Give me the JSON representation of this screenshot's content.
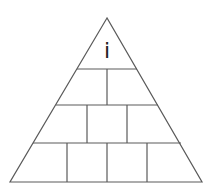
{
  "diagram": {
    "type": "pyramid",
    "apex_label": "i",
    "rows": [
      {
        "level": 1,
        "cells": 1,
        "labels": [
          "i"
        ]
      },
      {
        "level": 2,
        "cells": 2,
        "labels": [
          "",
          ""
        ]
      },
      {
        "level": 3,
        "cells": 3,
        "labels": [
          "",
          "",
          ""
        ]
      },
      {
        "level": 4,
        "cells": 4,
        "labels": [
          "",
          "",
          "",
          ""
        ]
      }
    ],
    "colors": {
      "stroke": "#5a5a5a",
      "background": "#ffffff",
      "text": "#222222"
    }
  }
}
